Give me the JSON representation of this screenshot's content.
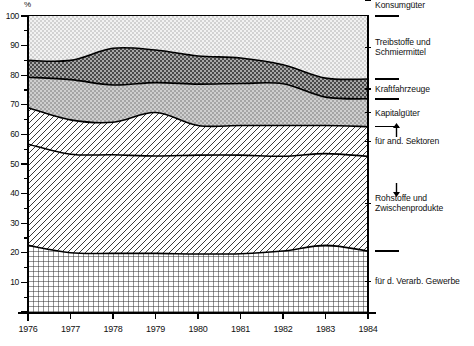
{
  "chart_data": {
    "type": "area",
    "stacked": true,
    "title": "",
    "xlabel": "",
    "ylabel": "%",
    "ylim": [
      0,
      100
    ],
    "xlim": [
      1976,
      1984
    ],
    "grid": false,
    "legend_position": "right",
    "x": [
      1976,
      1977,
      1978,
      1979,
      1980,
      1981,
      1982,
      1983,
      1984
    ],
    "xtick_labels": [
      "1976",
      "1977",
      "1978",
      "1979",
      "1980",
      "1981",
      "1982",
      "1983",
      "1984"
    ],
    "ytick_labels": [
      "0",
      "10",
      "20",
      "30",
      "40",
      "50",
      "60",
      "70",
      "80",
      "90",
      "100"
    ],
    "ytick_values": [
      0,
      10,
      20,
      30,
      40,
      50,
      60,
      70,
      80,
      90,
      100
    ],
    "series": [
      {
        "name": "Konsumgüter",
        "values": [
          22.5,
          20.0,
          19.8,
          19.8,
          19.6,
          19.7,
          20.6,
          22.5,
          20.6
        ]
      },
      {
        "name": "Rohstoffe und Zwischenprodukte (für d. Verarb. Gewerbe)",
        "values": [
          34.2,
          33.3,
          33.3,
          32.9,
          33.4,
          33.3,
          32.0,
          31.0,
          32.0
        ]
      },
      {
        "name": "Rohstoffe und Zwischenprodukte (für and. Sektoren)",
        "values": [
          12.3,
          11.6,
          11.0,
          14.7,
          10.0,
          10.0,
          10.4,
          9.5,
          10.0
        ]
      },
      {
        "name": "Kapitalgüter",
        "values": [
          10.3,
          13.6,
          12.6,
          10.1,
          14.0,
          14.2,
          14.1,
          9.6,
          9.4
        ]
      },
      {
        "name": "Kraftfahrzeuge",
        "values": [
          5.7,
          6.5,
          12.4,
          11.0,
          9.5,
          8.6,
          6.4,
          6.4,
          6.7
        ]
      },
      {
        "name": "Treibstoffe und Schmiermittel",
        "values": [
          15.0,
          15.0,
          10.9,
          11.5,
          13.5,
          14.2,
          16.5,
          21.0,
          21.3
        ]
      }
    ],
    "cumulative_boundaries": {
      "konsumgueter_top": [
        22.5,
        20.0,
        19.8,
        19.8,
        19.6,
        19.7,
        20.6,
        22.5,
        20.6
      ],
      "verarb_gewerbe_top": [
        56.7,
        53.3,
        53.1,
        52.7,
        53.0,
        53.0,
        52.6,
        53.5,
        52.6
      ],
      "rohstoffe_top": [
        69.0,
        64.9,
        64.1,
        67.4,
        63.0,
        63.0,
        63.0,
        63.0,
        62.6
      ],
      "kapitalgueter_top": [
        79.3,
        78.5,
        76.7,
        77.5,
        77.0,
        77.2,
        77.1,
        72.6,
        72.0
      ],
      "kraftfahrzeuge_top": [
        85.0,
        85.0,
        89.1,
        88.5,
        86.5,
        85.8,
        83.5,
        79.0,
        78.7
      ],
      "treibstoffe_top": [
        100,
        100,
        100,
        100,
        100,
        100,
        100,
        100,
        100
      ]
    }
  },
  "axis": {
    "unit_label": "%"
  },
  "legend": {
    "items": [
      {
        "label_line1": "Treibstoffe und",
        "label_line2": "Schmiermittel",
        "swatch": "dotted-light"
      },
      {
        "label_line1": "Kraftfahrzeuge",
        "label_line2": "",
        "swatch": "dark-gray"
      },
      {
        "label_line1": "Kapitalgüter",
        "label_line2": "",
        "swatch": "mid-gray"
      },
      {
        "label_line1": "für and. Sektoren",
        "label_line2": "",
        "swatch": "none"
      },
      {
        "label_line1": "Rohstoffe und",
        "label_line2": "Zwischenprodukte",
        "swatch": "diagonal-hatch"
      },
      {
        "label_line1": "für d. Verarb. Gewerbe",
        "label_line2": "",
        "swatch": "none"
      },
      {
        "label_line1": "Konsumgüter",
        "label_line2": "",
        "swatch": "crosshatch-grid"
      }
    ]
  },
  "colors": {
    "ink": "#000000",
    "paper": "#ffffff",
    "band_treibstoffe": "#e2e2e2",
    "band_kraftfahrzeuge": "#8c8c8c",
    "band_kapitalgueter": "#b9b9b9",
    "band_rohstoffe": "#ffffff",
    "band_konsumgueter": "#ffffff"
  }
}
